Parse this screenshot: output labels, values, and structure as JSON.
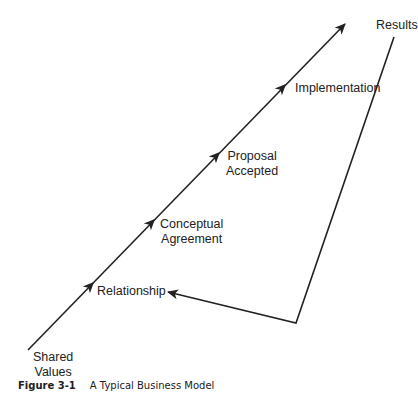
{
  "diagram": {
    "stages": [
      {
        "label_lines": [
          "Shared",
          "Values"
        ]
      },
      {
        "label_lines": [
          "Relationship"
        ]
      },
      {
        "label_lines": [
          "Conceptual",
          "Agreement"
        ]
      },
      {
        "label_lines": [
          "Proposal",
          "Accepted"
        ]
      },
      {
        "label_lines": [
          "Implementation"
        ]
      },
      {
        "label_lines": [
          "Results"
        ]
      }
    ],
    "feedback_arrow": {
      "from": "Results",
      "to": "Relationship"
    },
    "line_color": "#222222"
  },
  "caption": {
    "number": "Figure 3-1",
    "text": "A Typical Business Model"
  }
}
